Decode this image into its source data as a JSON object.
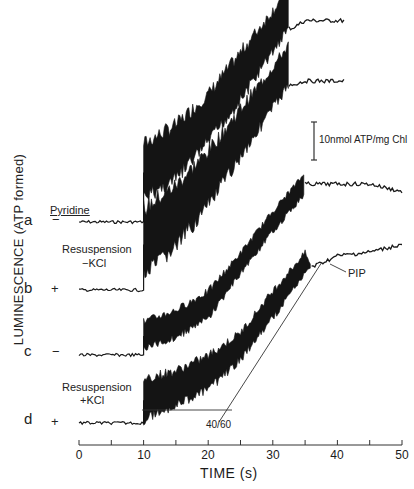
{
  "chart_data": {
    "type": "line",
    "title": "",
    "xlabel": "TIME (s)",
    "ylabel": "LUMINESCENCE (ATP formed)",
    "xlim": [
      0,
      50
    ],
    "xticks": [
      0,
      10,
      20,
      30,
      40,
      50
    ],
    "xminor_ticks": [
      5,
      15,
      25,
      35,
      45
    ],
    "grid": false,
    "legend": "none (traces labeled inline at left)",
    "scale_bar": {
      "label": "10nmol ATP/mg Chl",
      "value": 10,
      "units": "nmol ATP/mg Chl"
    },
    "group_labels": [
      {
        "text": "Pyridine",
        "applies_to": "column header above +/- signs"
      },
      {
        "text": "Resuspension -KCl",
        "applies_to": [
          "a",
          "b"
        ]
      },
      {
        "text": "Resuspension +KCl",
        "applies_to": [
          "c",
          "d"
        ]
      }
    ],
    "annotations": [
      {
        "text": "PIP",
        "target": "trace d, ~36 s, start of plateau"
      },
      {
        "text": "40/60",
        "target": "tangent line on trace d rising phase"
      }
    ],
    "series": [
      {
        "name": "a",
        "pyridine": "-",
        "light_on_s": 10,
        "light_off_s": 32.5,
        "x": [
          0,
          10,
          10,
          15,
          20,
          25,
          30,
          32.5,
          33,
          35,
          38,
          41
        ],
        "relative_atp": [
          0,
          0,
          13,
          18,
          27,
          38,
          50,
          56,
          51,
          53,
          53,
          53
        ],
        "band_width": [
          0,
          0,
          8,
          8,
          7,
          7,
          6,
          6,
          0,
          0,
          0,
          0
        ]
      },
      {
        "name": "b",
        "pyridine": "+",
        "light_on_s": 10,
        "light_off_s": 32.5,
        "x": [
          0,
          10,
          10,
          15,
          20,
          25,
          30,
          32.5,
          33,
          35,
          38,
          41
        ],
        "relative_atp": [
          0,
          0,
          12,
          19,
          29,
          41,
          53,
          59,
          54,
          55,
          55,
          55
        ],
        "band_width": [
          0,
          0,
          10,
          9,
          8,
          7,
          6,
          6,
          0,
          0,
          0,
          0
        ]
      },
      {
        "name": "c",
        "pyridine": "-",
        "light_on_s": 10,
        "light_off_s": 35,
        "x": [
          0,
          10,
          10,
          15,
          20,
          25,
          30,
          35,
          36,
          40,
          45,
          50
        ],
        "relative_atp": [
          0,
          0,
          5,
          8,
          13,
          24,
          35,
          45,
          45,
          45,
          45,
          43
        ],
        "band_width": [
          0,
          0,
          4,
          4,
          4,
          3,
          3,
          3,
          0,
          0,
          0,
          0
        ]
      },
      {
        "name": "d",
        "pyridine": "+",
        "light_on_s": 10,
        "light_off_s": 36,
        "x": [
          0,
          10,
          10,
          15,
          20,
          25,
          30,
          35,
          36,
          40,
          45,
          50
        ],
        "relative_atp": [
          0,
          0,
          6,
          9,
          13,
          20,
          31,
          42,
          41,
          44,
          45,
          47
        ],
        "band_width": [
          0,
          0,
          6,
          5,
          5,
          4,
          4,
          3,
          0,
          0,
          0,
          0
        ]
      }
    ]
  },
  "labels": {
    "ylabel": "LUMINESCENCE (ATP formed)",
    "xtitle": "TIME (s)",
    "pyridine": "Pyridine",
    "resusp_minus_1": "Resuspension",
    "resusp_minus_2": "−KCl",
    "resusp_plus_1": "Resuspension",
    "resusp_plus_2": "+KCl",
    "scale": "10nmol ATP/mg Chl",
    "pip": "PIP",
    "ratio": "40/60",
    "traces": [
      {
        "letter": "a",
        "sign": "−"
      },
      {
        "letter": "b",
        "sign": "+"
      },
      {
        "letter": "c",
        "sign": "−"
      },
      {
        "letter": "d",
        "sign": "+"
      }
    ],
    "ticks": [
      "0",
      "10",
      "20",
      "30",
      "40",
      "50"
    ]
  },
  "layout": {
    "x0_px": 79,
    "x1_px": 402,
    "baselines_px": [
      222,
      290,
      355,
      423
    ],
    "px_per_unit": 3.8
  }
}
